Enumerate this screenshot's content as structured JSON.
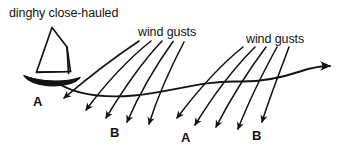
{
  "figure": {
    "type": "line-diagram",
    "background_color": "#ffffff",
    "ink_color": "#131313",
    "width": 358,
    "height": 156
  },
  "labels": {
    "title": "dinghy close-hauled",
    "gust_left": "wind gusts",
    "gust_right": "wind gusts",
    "point_a_left": "A",
    "point_b_left": "B",
    "point_a_right": "A",
    "point_b_right": "B"
  },
  "boat": {
    "name": "dinghy",
    "sail_outline": "M 52,28 L 36,72 L 71,71 L 67,47 Z",
    "hull": "M 26,78 C 40,86 66,87 80,79 C 66,82 40,82 26,78 Z",
    "mast_x": 67,
    "boom_y": 71
  },
  "track": {
    "name": "dinghy-track",
    "path": "M 58,83 C 78,94 104,99 140,95 C 176,91 206,80 240,81 C 268,82 288,76 306,70 C 316,67 324,66 332,66",
    "arrow_tip": [
      341,
      66
    ],
    "arrowhead": "M 325,60 L 343,66 L 324,71 C 330,68 330,63 325,60 Z"
  },
  "gust_groups": [
    {
      "name": "gust-group-left",
      "label": "wind gusts",
      "label_pos": [
        138,
        26
      ],
      "arrows": [
        {
          "path": "M 138,41 C 116,56 86,78 61,100",
          "head": [
            58,
            103
          ]
        },
        {
          "path": "M 150,41 C 130,58 104,85 82,112",
          "head": [
            79,
            116
          ]
        },
        {
          "path": "M 161,41 C 144,60 122,90 103,120",
          "head": [
            100,
            124
          ]
        },
        {
          "path": "M 172,41 C 158,62 140,92 125,124",
          "head": [
            123,
            128
          ]
        },
        {
          "path": "M 183,42 C 172,64 158,94 147,126",
          "head": [
            145,
            130
          ]
        }
      ]
    },
    {
      "name": "gust-group-right",
      "label": "wind gusts",
      "label_pos": [
        246,
        33
      ],
      "arrows": [
        {
          "path": "M 242,47 C 222,64 196,92 174,120",
          "head": [
            171,
            124
          ]
        },
        {
          "path": "M 254,47 C 236,66 212,96 192,127",
          "head": [
            189,
            131
          ]
        },
        {
          "path": "M 265,47 C 250,68 230,98 213,129",
          "head": [
            211,
            133
          ]
        },
        {
          "path": "M 276,47 C 264,70 248,100 235,131",
          "head": [
            233,
            135
          ]
        },
        {
          "path": "M 288,47 C 280,70 268,100 259,126",
          "head": [
            257,
            130
          ]
        }
      ]
    }
  ],
  "point_labels": [
    {
      "text": "A",
      "x": 33,
      "y": 95
    },
    {
      "text": "B",
      "x": 110,
      "y": 126
    },
    {
      "text": "A",
      "x": 181,
      "y": 131
    },
    {
      "text": "B",
      "x": 252,
      "y": 129
    }
  ]
}
